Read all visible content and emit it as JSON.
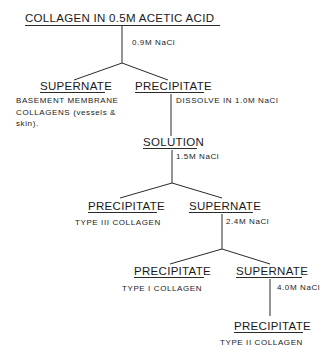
{
  "title": "COLLAGEN IN 0.5M ACETIC ACID",
  "steps": {
    "step1_reagent": "0.9M NaCl",
    "step1_left": {
      "label": "SUPERNATE",
      "desc": [
        "BASEMENT  MEMBRANE",
        "COLLAGENS  (vessels  &",
        "skin)."
      ]
    },
    "step1_right": {
      "label": "PRECIPITATE",
      "note": "DISSOLVE  IN  1.0M  NaCl"
    },
    "solution": {
      "label": "SOLUTION",
      "reagent": "1.5M  NaCl"
    },
    "step2_left": {
      "label": "PRECIPITATE",
      "desc": "TYPE  III  COLLAGEN"
    },
    "step2_right": {
      "label": "SUPERNATE",
      "reagent": "2.4M  NaCl"
    },
    "step3_left": {
      "label": "PRECIPITATE",
      "desc": "TYPE  I  COLLAGEN"
    },
    "step3_right": {
      "label": "SUPERNATE",
      "reagent": "4.0M  NaCl"
    },
    "step4": {
      "label": "PRECIPITATE",
      "desc": "TYPE  II  COLLAGEN"
    }
  }
}
